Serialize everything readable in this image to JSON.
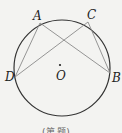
{
  "diagram": {
    "type": "circle-geometry",
    "circle": {
      "cx": 62,
      "cy": 68,
      "r": 48,
      "stroke": "#333333"
    },
    "center": {
      "label": "O",
      "x": 60,
      "y": 65
    },
    "points": [
      {
        "label": "A",
        "x": 40,
        "y": 23,
        "lx": 33,
        "ly": 20
      },
      {
        "label": "C",
        "x": 88,
        "y": 22,
        "lx": 87,
        "ly": 19
      },
      {
        "label": "D",
        "x": 15,
        "y": 77,
        "lx": 5,
        "ly": 81
      },
      {
        "label": "B",
        "x": 110,
        "y": 73,
        "lx": 112,
        "ly": 82
      }
    ],
    "segments": [
      [
        "A",
        "D"
      ],
      [
        "A",
        "B"
      ],
      [
        "C",
        "D"
      ],
      [
        "C",
        "B"
      ]
    ],
    "segment_color": "#8a8a8a",
    "caption": "(第 题)"
  }
}
